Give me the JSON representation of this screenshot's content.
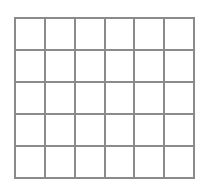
{
  "grid": {
    "rows": 5,
    "columns": 6,
    "line_color": "#8a8a8a",
    "cell_color": "#ffffff"
  }
}
